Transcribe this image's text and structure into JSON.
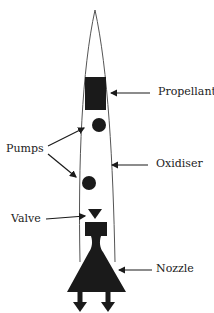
{
  "diagram": {
    "type": "rocket engine schematic",
    "labels": {
      "propellant": "Propellant",
      "pumps": "Pumps",
      "oxidiser": "Oxidiser",
      "valve": "Valve",
      "nozzle": "Nozzle"
    },
    "colors": {
      "fill": "#1a1a1a",
      "stroke": "#555555",
      "text": "#222222"
    }
  }
}
